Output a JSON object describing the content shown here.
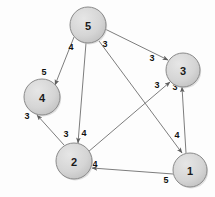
{
  "figure": {
    "type": "directed-weighted-graph",
    "background_color": "#fdfdfd",
    "node_fill": "#d4d4d4",
    "node_stroke": "#8a8a8a",
    "edge_color": "#6e6e6e",
    "label_color": "#1a1a1a"
  },
  "nodes": [
    {
      "id": "5",
      "label": "5",
      "cx": 88,
      "cy": 25,
      "r": 18
    },
    {
      "id": "3",
      "label": "3",
      "cx": 183,
      "cy": 70,
      "r": 17
    },
    {
      "id": "4",
      "label": "4",
      "cx": 42,
      "cy": 97,
      "r": 18
    },
    {
      "id": "2",
      "label": "2",
      "cx": 74,
      "cy": 161,
      "r": 18
    },
    {
      "id": "1",
      "label": "1",
      "cx": 190,
      "cy": 170,
      "r": 17
    }
  ],
  "edges": [
    {
      "id": "e-5-4",
      "from": "5",
      "to": "4",
      "weight": "5",
      "x1": 74,
      "y1": 37,
      "x2": 55,
      "y2": 85,
      "labels": [
        {
          "text": "4",
          "x": 71,
          "y": 47
        },
        {
          "text": "5",
          "x": 44,
          "y": 72
        }
      ]
    },
    {
      "id": "e-5-3",
      "from": "5",
      "to": "3",
      "weight": "3",
      "x1": 105,
      "y1": 29,
      "x2": 168,
      "y2": 60,
      "labels": [
        {
          "text": "3",
          "x": 105,
          "y": 44
        },
        {
          "text": "3",
          "x": 152,
          "y": 58
        }
      ]
    },
    {
      "id": "e-5-2",
      "from": "5",
      "to": "2",
      "weight": "4",
      "x1": 86,
      "y1": 43,
      "x2": 78,
      "y2": 143,
      "labels": [
        {
          "text": "4",
          "x": 84,
          "y": 133
        }
      ]
    },
    {
      "id": "e-5-1",
      "from": "5",
      "to": "1",
      "weight": "4",
      "x1": 99,
      "y1": 41,
      "x2": 182,
      "y2": 153,
      "labels": [
        {
          "text": "4",
          "x": 177,
          "y": 135
        }
      ]
    },
    {
      "id": "e-2-4",
      "from": "2",
      "to": "4",
      "weight": "3",
      "x1": 64,
      "y1": 145,
      "x2": 37,
      "y2": 115,
      "labels": [
        {
          "text": "3",
          "x": 66,
          "y": 134
        },
        {
          "text": "3",
          "x": 27,
          "y": 116
        }
      ]
    },
    {
      "id": "e-2-3",
      "from": "2",
      "to": "3",
      "weight": "3",
      "x1": 88,
      "y1": 152,
      "x2": 170,
      "y2": 82,
      "labels": [
        {
          "text": "3",
          "x": 157,
          "y": 85
        }
      ]
    },
    {
      "id": "e-1-3",
      "from": "1",
      "to": "3",
      "weight": "3",
      "x1": 186,
      "y1": 153,
      "x2": 182,
      "y2": 87,
      "labels": [
        {
          "text": "3",
          "x": 175,
          "y": 87
        }
      ]
    },
    {
      "id": "e-1-2",
      "from": "1",
      "to": "2",
      "weight": "5",
      "x1": 173,
      "y1": 174,
      "x2": 92,
      "y2": 168,
      "labels": [
        {
          "text": "5",
          "x": 166,
          "y": 180
        },
        {
          "text": "4",
          "x": 95,
          "y": 164
        }
      ]
    }
  ],
  "chart_data": {
    "type": "diagram",
    "title": "",
    "node_ids": [
      "1",
      "2",
      "3",
      "4",
      "5"
    ],
    "adjacency": [
      {
        "source": "5",
        "target": "4",
        "weight": 5,
        "tail_label": 4,
        "head_label": 5
      },
      {
        "source": "5",
        "target": "3",
        "weight": 3,
        "tail_label": 3,
        "head_label": 3
      },
      {
        "source": "5",
        "target": "2",
        "weight": 4,
        "head_label": 4
      },
      {
        "source": "5",
        "target": "1",
        "weight": 4,
        "head_label": 4
      },
      {
        "source": "2",
        "target": "4",
        "weight": 3,
        "tail_label": 3,
        "head_label": 3
      },
      {
        "source": "2",
        "target": "3",
        "weight": 3,
        "head_label": 3
      },
      {
        "source": "1",
        "target": "3",
        "weight": 3,
        "head_label": 3
      },
      {
        "source": "1",
        "target": "2",
        "weight": 5,
        "tail_label": 5,
        "head_label": 4
      }
    ]
  }
}
